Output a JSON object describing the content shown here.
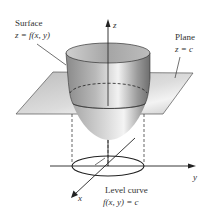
{
  "figure": {
    "surface_label": {
      "title": "Surface",
      "equation": "z = f(x, y)"
    },
    "plane_label": {
      "title": "Plane",
      "equation": "z = c"
    },
    "level_curve_label": {
      "title": "Level curve",
      "equation": "f(x, y) = c"
    },
    "axes": {
      "x": "x",
      "y": "y",
      "z": "z"
    },
    "colors": {
      "plane": "#cfcfcf",
      "surface_dark": "#7a7a7a",
      "surface_light": "#e8e8e8",
      "lines": "#222222"
    }
  }
}
